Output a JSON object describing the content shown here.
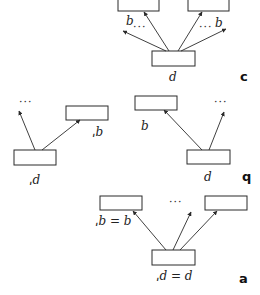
{
  "figure": {
    "orientation": "rotated-180",
    "colors": {
      "stroke": "#2a2a2a",
      "background": "#ffffff",
      "text": "#222222"
    },
    "panels": [
      {
        "id": "a",
        "panel_label": "a",
        "boxes": [
          {
            "name": "top-left",
            "x": 100,
            "y": 196,
            "w": 42,
            "h": 14
          },
          {
            "name": "top-right",
            "x": 205,
            "y": 196,
            "w": 42,
            "h": 14
          },
          {
            "name": "bottom",
            "x": 152,
            "y": 250,
            "w": 43,
            "h": 15
          }
        ],
        "labels": {
          "top_left_label": "ˌb = b",
          "bottom_label": "ˌd = d",
          "ellipsis": "···"
        }
      },
      {
        "id": "b",
        "panel_label": "q",
        "left_group": {
          "boxes": [
            {
              "name": "top",
              "x": 66,
              "y": 106,
              "w": 42,
              "h": 14
            },
            {
              "name": "bottom",
              "x": 14,
              "y": 150,
              "w": 42,
              "h": 15
            }
          ],
          "labels": {
            "top_label": "ˌb",
            "bottom_label": "ˌd",
            "ellipsis": "···"
          }
        },
        "right_group": {
          "boxes": [
            {
              "name": "top",
              "x": 135,
              "y": 96,
              "w": 42,
              "h": 14
            },
            {
              "name": "bottom",
              "x": 187,
              "y": 150,
              "w": 43,
              "h": 14
            }
          ],
          "labels": {
            "top_label": "b",
            "bottom_label": "d",
            "ellipsis": "···"
          }
        }
      },
      {
        "id": "c",
        "panel_label": "c",
        "boxes": [
          {
            "name": "top-left",
            "x": 118,
            "y": -3,
            "w": 41,
            "h": 14
          },
          {
            "name": "top-right",
            "x": 188,
            "y": -3,
            "w": 41,
            "h": 14
          },
          {
            "name": "bottom",
            "x": 152,
            "y": 51,
            "w": 43,
            "h": 15
          }
        ],
        "labels": {
          "left_arrow_label": "b",
          "right_arrow_label": "b",
          "bottom_label": "d",
          "ellipsis": "···"
        }
      }
    ]
  }
}
